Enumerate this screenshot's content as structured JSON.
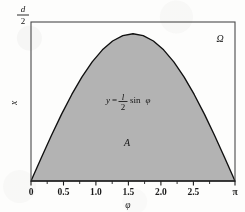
{
  "figure": {
    "kind": "math-plot",
    "background_color": "#fdfdfc",
    "frame_color": "#3a3a3a",
    "curve_color": "#101010",
    "fill_color": "#b3b3b3"
  },
  "axes": {
    "x_axis_title": "φ",
    "y_axis_title": "x",
    "y_top_label_numerator": "d",
    "y_top_label_denominator": "2",
    "x_tick_labels": [
      "0",
      "0.5",
      "1.0",
      "1.5",
      "2.0",
      "2.5",
      "π"
    ],
    "x_tick_values": [
      0,
      0.5,
      1.0,
      1.5,
      2.0,
      2.5,
      3.14159265
    ],
    "x_minor_tick_values": [
      0.25,
      0.75,
      1.25,
      1.75,
      2.25,
      2.75
    ],
    "x_limits": [
      0,
      3.14159265
    ],
    "y_limits": [
      0,
      1.08
    ],
    "grid": "off"
  },
  "annotations": {
    "equation_lhs": "y",
    "equation_equals": "=",
    "equation_numerator": "l",
    "equation_denominator": "2",
    "equation_rhs": "sin",
    "equation_variable": "φ",
    "region_area_label": "A",
    "region_omega_label": "Ω"
  },
  "chart_data": {
    "type": "area",
    "title": "",
    "xlabel": "φ",
    "ylabel": "x",
    "xlim": [
      0,
      3.14159265
    ],
    "ylim": [
      0,
      1.08
    ],
    "xticks": [
      0,
      0.5,
      1.0,
      1.5,
      2.0,
      2.5,
      3.14159265
    ],
    "xticklabels": [
      "0",
      "0.5",
      "1.0",
      "1.5",
      "2.0",
      "2.5",
      "π"
    ],
    "yticks": [
      1.0
    ],
    "yticklabels": [
      "d/2"
    ],
    "grid": false,
    "legend": null,
    "series": [
      {
        "name": "y = (l/2) sin φ",
        "fill": "#b3b3b3",
        "line_color": "#101010",
        "x": [
          0.0,
          0.15708,
          0.31416,
          0.47124,
          0.62832,
          0.7854,
          0.94248,
          1.09956,
          1.25664,
          1.41372,
          1.5708,
          1.72788,
          1.88496,
          2.04204,
          2.19911,
          2.35619,
          2.51327,
          2.67035,
          2.82743,
          2.98451,
          3.14159
        ],
        "y": [
          0.0,
          0.15643,
          0.30902,
          0.45399,
          0.58779,
          0.70711,
          0.80902,
          0.89101,
          0.95106,
          0.98769,
          1.0,
          0.98769,
          0.95106,
          0.89101,
          0.80902,
          0.70711,
          0.58779,
          0.45399,
          0.30902,
          0.15643,
          0.0
        ]
      }
    ],
    "annotations": [
      {
        "text": "y = (l/2) sin φ",
        "x": 1.5,
        "y": 0.62
      },
      {
        "text": "A",
        "x": 1.5,
        "y": 0.3
      },
      {
        "text": "Ω",
        "x": 2.92,
        "y": 0.95
      }
    ]
  }
}
